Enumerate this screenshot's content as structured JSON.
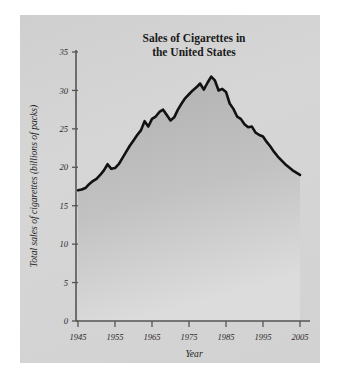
{
  "chart_data": {
    "type": "area",
    "title": "Sales of Cigarettes in the United States",
    "title_line1": "Sales of Cigarettes in",
    "title_line2": "the United States",
    "xlabel": "Year",
    "ylabel": "Total sales of cigarettes (billions of packs)",
    "xlim": [
      1945,
      2005
    ],
    "ylim": [
      0,
      35
    ],
    "grid": false,
    "legend": null,
    "xticks": [
      1945,
      1955,
      1965,
      1975,
      1985,
      1995,
      2005
    ],
    "xtick_labels": [
      "1945",
      "1955",
      "1965",
      "1975",
      "1985",
      "1995",
      "2005"
    ],
    "yticks": [
      0,
      5,
      10,
      15,
      20,
      25,
      30,
      35
    ],
    "ytick_labels": [
      "0",
      "5",
      "10",
      "15",
      "20",
      "25",
      "30",
      "35"
    ],
    "line_color": "#111111",
    "fill_color": "#b9b9b9",
    "panel_color": "#d2d2d2",
    "x": [
      1945,
      1946,
      1947,
      1948,
      1949,
      1950,
      1951,
      1952,
      1953,
      1954,
      1955,
      1956,
      1957,
      1958,
      1959,
      1960,
      1961,
      1962,
      1963,
      1964,
      1965,
      1966,
      1967,
      1968,
      1969,
      1970,
      1971,
      1972,
      1973,
      1974,
      1975,
      1976,
      1977,
      1978,
      1979,
      1980,
      1981,
      1982,
      1983,
      1984,
      1985,
      1986,
      1987,
      1988,
      1989,
      1990,
      1991,
      1992,
      1993,
      1994,
      1995,
      1996,
      1997,
      1998,
      1999,
      2000,
      2001,
      2002,
      2003,
      2004,
      2005
    ],
    "values": [
      17.0,
      17.1,
      17.3,
      17.8,
      18.2,
      18.5,
      19.0,
      19.6,
      20.4,
      19.8,
      19.9,
      20.4,
      21.2,
      22.0,
      22.8,
      23.5,
      24.2,
      24.8,
      26.0,
      25.3,
      26.3,
      26.6,
      27.2,
      27.5,
      26.8,
      26.1,
      26.5,
      27.5,
      28.3,
      29.0,
      29.5,
      30.0,
      30.4,
      30.9,
      30.1,
      31.0,
      31.8,
      31.3,
      30.0,
      30.2,
      29.8,
      28.3,
      27.6,
      26.6,
      26.3,
      25.6,
      25.2,
      25.3,
      24.5,
      24.2,
      24.0,
      23.3,
      22.7,
      22.0,
      21.4,
      20.9,
      20.4,
      20.0,
      19.6,
      19.3,
      19.0
    ]
  }
}
